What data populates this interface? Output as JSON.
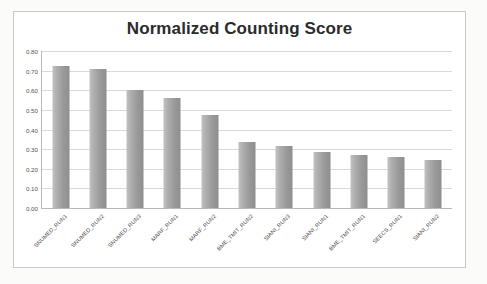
{
  "chart_data": {
    "type": "bar",
    "title": "Normalized Counting Score",
    "xlabel": "",
    "ylabel": "",
    "ylim": [
      0.0,
      0.8
    ],
    "grid": true,
    "legend": "none",
    "ytick_labels": [
      "0.80",
      "0.70",
      "0.60",
      "0.50",
      "0.40",
      "0.30",
      "0.20",
      "0.10",
      "0.00"
    ],
    "ytick_values": [
      0.8,
      0.7,
      0.6,
      0.5,
      0.4,
      0.3,
      0.2,
      0.1,
      0.0
    ],
    "categories": [
      "SNUMED_RUN1",
      "SNUMED_RUN2",
      "SNUMED_RUN3",
      "MARF_RUN1",
      "MARF_RUN2",
      "BME_TMIT_RUN2",
      "SIANI_RUN3",
      "SIANI_RUN1",
      "BME_TMIT_RUN1",
      "SEECS_RUN1",
      "SIANI_RUN2"
    ],
    "values": [
      0.725,
      0.71,
      0.6,
      0.56,
      0.475,
      0.335,
      0.315,
      0.285,
      0.27,
      0.26,
      0.245
    ],
    "bar_color_light": "#c2c2c2",
    "bar_color_dark": "#8e8e8e",
    "gridline_color": "#d9d9d9",
    "axis_color": "#b9b9b9",
    "plot_background": "#ffffff",
    "title_color": "#2b2b2b"
  }
}
